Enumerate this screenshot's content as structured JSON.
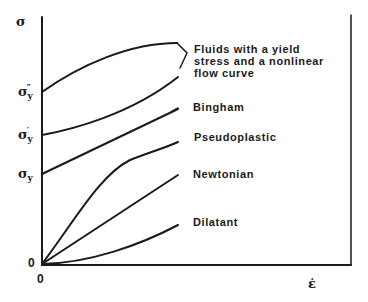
{
  "diagram": {
    "y_axis_symbol": "σ",
    "x_axis_symbol": "ε̇",
    "origin_y_label": "0",
    "origin_x_label": "0",
    "yield_labels": [
      {
        "base": "σ",
        "sub": "y",
        "prime": "″"
      },
      {
        "base": "σ",
        "sub": "y",
        "prime": "′"
      },
      {
        "base": "σ",
        "sub": "y",
        "prime": ""
      }
    ],
    "curve_labels": {
      "nonlinear_yield_line1": "Fluids with a yield",
      "nonlinear_yield_line2": "stress and a nonlinear",
      "nonlinear_yield_line3": "flow curve",
      "bingham": "Bingham",
      "pseudoplastic": "Pseudoplastic",
      "newtonian": "Newtonian",
      "dilatant": "Dilatant"
    },
    "colors": {
      "line": "#1a1a1a",
      "background": "#ffffff"
    }
  }
}
